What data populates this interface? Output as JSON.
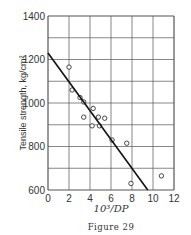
{
  "chart_data": {
    "type": "scatter",
    "title": "",
    "caption": "Figure 29",
    "xlabel": "10³/DP",
    "ylabel": "Tensile strength, kg/cm²",
    "xlim": [
      0,
      12
    ],
    "ylim": [
      600,
      1400
    ],
    "xticks": [
      0,
      2,
      4,
      6,
      8,
      10,
      12
    ],
    "yticks": [
      600,
      800,
      1000,
      1200,
      1400
    ],
    "x_grid_step": 2,
    "y_grid_step": 100,
    "grid": true,
    "series": [
      {
        "name": "measurements",
        "marker": "open-circle",
        "points": [
          [
            2.0,
            1165
          ],
          [
            2.3,
            1060
          ],
          [
            3.05,
            1025
          ],
          [
            3.4,
            1005
          ],
          [
            4.3,
            975
          ],
          [
            3.4,
            935
          ],
          [
            4.8,
            935
          ],
          [
            4.2,
            895
          ],
          [
            4.9,
            895
          ],
          [
            5.4,
            930
          ],
          [
            6.1,
            830
          ],
          [
            7.5,
            815
          ],
          [
            7.9,
            630
          ],
          [
            10.8,
            665
          ]
        ]
      },
      {
        "name": "fitted line",
        "type": "line",
        "points": [
          [
            0,
            1230
          ],
          [
            9.5,
            600
          ]
        ]
      }
    ]
  }
}
